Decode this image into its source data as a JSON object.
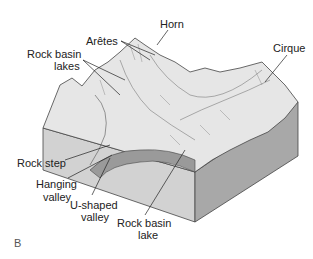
{
  "figure": {
    "panel_letter": "B",
    "labels": {
      "horn": "Horn",
      "aretes": "Arêtes",
      "rock_basin_lakes_1": "Rock basin",
      "rock_basin_lakes_2": "lakes",
      "cirque": "Cirque",
      "rock_step": "Rock step",
      "hanging_valley_1": "Hanging",
      "hanging_valley_2": "valley",
      "u_shaped_valley_1": "U-shaped",
      "u_shaped_valley_2": "valley",
      "rock_basin_lake_1": "Rock basin",
      "rock_basin_lake_2": "lake"
    }
  }
}
